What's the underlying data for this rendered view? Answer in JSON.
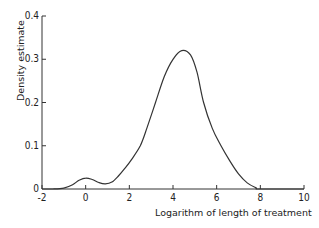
{
  "chart_data": {
    "type": "line",
    "title": "",
    "xlabel": "Logarithm of length of treatment",
    "ylabel": "Density estimate",
    "xlim": [
      -2,
      10
    ],
    "ylim": [
      0,
      0.4
    ],
    "x_ticks": [
      -2,
      0,
      2,
      4,
      6,
      8,
      10
    ],
    "y_ticks": [
      0,
      0.1,
      0.2,
      0.3,
      0.4
    ],
    "x_tick_labels": [
      "-2",
      "0",
      "2",
      "4",
      "6",
      "8",
      "10"
    ],
    "y_tick_labels": [
      "0",
      "0.1",
      "0.2",
      "0.3",
      "0.4"
    ],
    "grid": false,
    "legend": null,
    "series": [
      {
        "name": "Density estimate",
        "x": [
          -2.0,
          -1.5,
          -1.0,
          -0.6,
          -0.3,
          0.0,
          0.3,
          0.6,
          0.9,
          1.2,
          1.5,
          1.8,
          2.1,
          2.5,
          2.8,
          3.2,
          3.6,
          4.0,
          4.4,
          4.8,
          5.1,
          5.4,
          5.8,
          6.2,
          6.6,
          7.0,
          7.4,
          7.8,
          8.0,
          10.0
        ],
        "y": [
          0.0,
          0.0,
          0.002,
          0.01,
          0.02,
          0.025,
          0.022,
          0.015,
          0.012,
          0.016,
          0.03,
          0.048,
          0.068,
          0.1,
          0.14,
          0.2,
          0.26,
          0.3,
          0.32,
          0.31,
          0.27,
          0.2,
          0.14,
          0.1,
          0.065,
          0.035,
          0.014,
          0.003,
          0.0,
          0.0
        ]
      }
    ]
  }
}
